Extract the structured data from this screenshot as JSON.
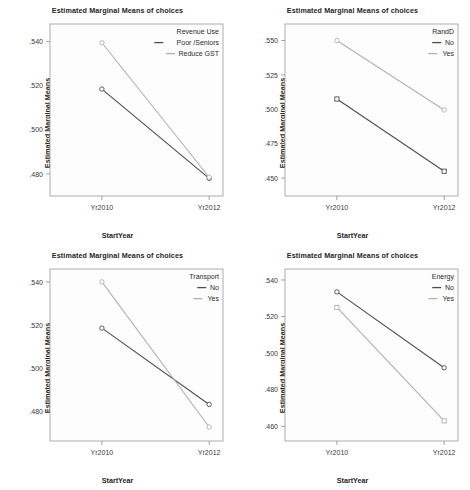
{
  "figure": {
    "layout": "2x2 panel grid",
    "panel_count": 4
  },
  "chart_data": [
    {
      "type": "line",
      "panel": "top-left",
      "title": "Estimated Marginal Means of choices",
      "xlabel": "StartYear",
      "ylabel": "Estimated Marginal Means",
      "categories": [
        "Yr2010",
        "Yr2012"
      ],
      "x": [
        "Yr2010",
        "Yr2012"
      ],
      "ylim": [
        0.47,
        0.548
      ],
      "yticks": [
        0.48,
        0.5,
        0.52,
        0.54
      ],
      "ytick_labels": [
        ".480",
        ".500",
        ".520",
        ".540"
      ],
      "grid": false,
      "legend_title": "Revenue Use",
      "legend_position": "top-right inside",
      "series": [
        {
          "name": "Poor /Seniors",
          "values": [
            0.5185,
            0.478
          ],
          "color": "#4d4d4d",
          "marker": "circle"
        },
        {
          "name": "Reduce GST",
          "values": [
            0.5395,
            0.4785
          ],
          "color": "#b0b0b0",
          "marker": "circle"
        }
      ]
    },
    {
      "type": "line",
      "panel": "top-right",
      "title": "Estimated Marginal Means of choices",
      "xlabel": "StartYear",
      "ylabel": "Estimated Marginal Means",
      "categories": [
        "Yr2010",
        "Yr2012"
      ],
      "x": [
        "Yr2010",
        "Yr2012"
      ],
      "ylim": [
        0.437,
        0.562
      ],
      "yticks": [
        0.45,
        0.475,
        0.5,
        0.525,
        0.55
      ],
      "ytick_labels": [
        ".450",
        ".475",
        ".500",
        ".525",
        ".550"
      ],
      "grid": false,
      "legend_title": "RandD",
      "legend_position": "top-right inside",
      "series": [
        {
          "name": "No",
          "values": [
            0.5075,
            0.455
          ],
          "color": "#4d4d4d",
          "marker": "square"
        },
        {
          "name": "Yes",
          "values": [
            0.55,
            0.4995
          ],
          "color": "#b0b0b0",
          "marker": "circle"
        }
      ]
    },
    {
      "type": "line",
      "panel": "bottom-left",
      "title": "Estimated Marginal Means of choices",
      "xlabel": "StartYear",
      "ylabel": "Estimated Marginal Means",
      "categories": [
        "Yr2010",
        "Yr2012"
      ],
      "x": [
        "Yr2010",
        "Yr2012"
      ],
      "ylim": [
        0.466,
        0.546
      ],
      "yticks": [
        0.48,
        0.5,
        0.52,
        0.54
      ],
      "ytick_labels": [
        ".480",
        ".500",
        ".520",
        ".540"
      ],
      "grid": false,
      "legend_title": "Transport",
      "legend_position": "top-right inside",
      "series": [
        {
          "name": "No",
          "values": [
            0.5185,
            0.483
          ],
          "color": "#4d4d4d",
          "marker": "circle"
        },
        {
          "name": "Yes",
          "values": [
            0.54,
            0.4725
          ],
          "color": "#b0b0b0",
          "marker": "circle"
        }
      ]
    },
    {
      "type": "line",
      "panel": "bottom-right",
      "title": "Estimated Marginal Means of choices",
      "xlabel": "StartYear",
      "ylabel": "Estimated Marginal Means",
      "categories": [
        "Yr2010",
        "Yr2012"
      ],
      "x": [
        "Yr2010",
        "Yr2012"
      ],
      "ylim": [
        0.452,
        0.546
      ],
      "yticks": [
        0.46,
        0.48,
        0.5,
        0.52,
        0.54
      ],
      "ytick_labels": [
        ".460",
        ".480",
        ".500",
        ".520",
        ".540"
      ],
      "grid": false,
      "legend_title": "Energy",
      "legend_position": "top-right inside",
      "series": [
        {
          "name": "No",
          "values": [
            0.5335,
            0.492
          ],
          "color": "#4d4d4d",
          "marker": "circle"
        },
        {
          "name": "Yes",
          "values": [
            0.525,
            0.463
          ],
          "color": "#b0b0b0",
          "marker": "square"
        }
      ]
    }
  ]
}
